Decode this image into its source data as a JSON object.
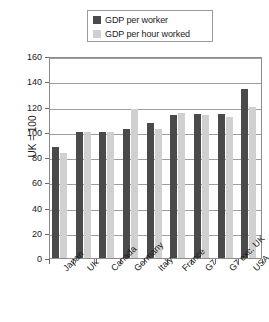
{
  "chart_data": {
    "type": "bar",
    "title": "",
    "xlabel": "",
    "ylabel": "UK = 100",
    "ylim": [
      0,
      160
    ],
    "ystep": 20,
    "grid": true,
    "legend_position": "top-center",
    "categories": [
      "Japan",
      "UK",
      "Canada",
      "Germany",
      "Italy",
      "France",
      "G7",
      "G7 exc. UK",
      "USA"
    ],
    "series": [
      {
        "name": "GDP per worker",
        "color": "#4a4a4a",
        "values": [
          88,
          100,
          100,
          102,
          107,
          113,
          114,
          114,
          134
        ]
      },
      {
        "name": "GDP per hour worked",
        "color": "#d0d0d0",
        "values": [
          83,
          100,
          100,
          118,
          102,
          115,
          113,
          112,
          120
        ]
      }
    ],
    "yticks": [
      0,
      20,
      40,
      60,
      80,
      100,
      120,
      140,
      160
    ]
  }
}
